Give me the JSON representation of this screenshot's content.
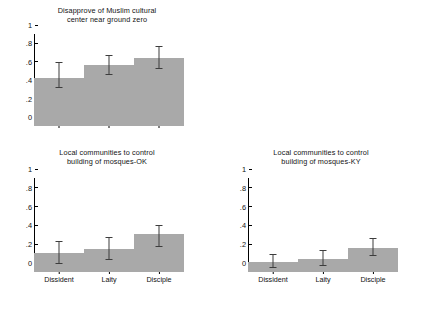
{
  "chart_data": [
    {
      "type": "bar",
      "panel": "top",
      "title": "Disapprove of Muslim cultural\ncenter near ground zero",
      "categories": [
        "Dissident",
        "Laity",
        "Disciple"
      ],
      "values": [
        0.52,
        0.66,
        0.74
      ],
      "errors_low": [
        0.41,
        0.55,
        0.62
      ],
      "errors_high": [
        0.7,
        0.77,
        0.87
      ],
      "xlabel": "",
      "ylabel": "",
      "ylim": [
        0,
        1
      ],
      "yticks": [
        "0",
        ".2",
        ".4",
        ".6",
        ".8",
        "1"
      ],
      "ytick_values": [
        0,
        0.2,
        0.4,
        0.6,
        0.8,
        1
      ],
      "show_xticklabels": false,
      "grid": false,
      "legend": "none"
    },
    {
      "type": "bar",
      "panel": "bottom-left",
      "title": "Local communities to control\nbuilding of mosques-OK",
      "categories": [
        "Dissident",
        "Laity",
        "Disciple"
      ],
      "values": [
        0.2,
        0.24,
        0.4
      ],
      "errors_low": [
        0.09,
        0.13,
        0.27
      ],
      "errors_high": [
        0.33,
        0.37,
        0.5
      ],
      "xlabel": "",
      "ylabel": "",
      "ylim": [
        0,
        1
      ],
      "yticks": [
        "0",
        ".2",
        ".4",
        ".6",
        ".8",
        "1"
      ],
      "ytick_values": [
        0,
        0.2,
        0.4,
        0.6,
        0.8,
        1
      ],
      "show_xticklabels": true,
      "grid": false,
      "legend": "none"
    },
    {
      "type": "bar",
      "panel": "bottom-right",
      "title": "Local communities to control\nbuilding of mosques-KY",
      "categories": [
        "Dissident",
        "Laity",
        "Disciple"
      ],
      "values": [
        0.11,
        0.14,
        0.26
      ],
      "errors_low": [
        0.04,
        0.06,
        0.17
      ],
      "errors_high": [
        0.19,
        0.23,
        0.36
      ],
      "xlabel": "",
      "ylabel": "",
      "ylim": [
        0,
        1
      ],
      "yticks": [
        "0",
        ".2",
        ".4",
        ".6",
        ".8",
        "1"
      ],
      "ytick_values": [
        0,
        0.2,
        0.4,
        0.6,
        0.8,
        1
      ],
      "show_xticklabels": true,
      "grid": false,
      "legend": "none"
    }
  ],
  "style": {
    "bar_color": "#a9a9a9",
    "error_color": "#3d3d3d",
    "axis_color": "#000000",
    "text_color": "#141414",
    "background": "#ffffff"
  }
}
